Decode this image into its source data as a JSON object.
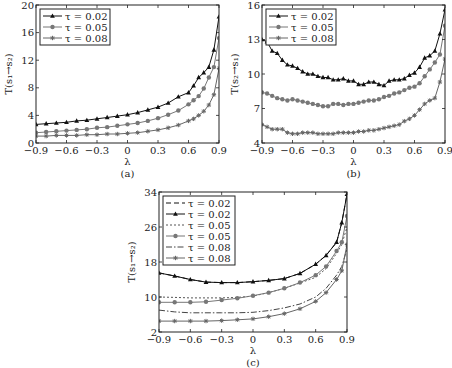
{
  "chart_data": [
    {
      "type": "line",
      "panel": "a",
      "caption": "(a)",
      "xlabel": "λ",
      "ylabel": "T(s₁→s₂)",
      "xlim": [
        -0.9,
        0.9
      ],
      "ylim": [
        0,
        20
      ],
      "xticks": [
        "-0.9",
        "-0.6",
        "-0.3",
        "0",
        "0.3",
        "0.6",
        "0.9"
      ],
      "yticks": [
        "0",
        "4",
        "8",
        "12",
        "16",
        "20"
      ],
      "grid": false,
      "legend_position": "upper left",
      "series": [
        {
          "name": "τ=0.02",
          "marker": "triangle",
          "line": "solid",
          "color": "#111111",
          "x": [
            -0.9,
            -0.8,
            -0.7,
            -0.6,
            -0.5,
            -0.4,
            -0.3,
            -0.2,
            -0.1,
            0,
            0.1,
            0.2,
            0.3,
            0.4,
            0.5,
            0.6,
            0.65,
            0.7,
            0.75,
            0.8,
            0.85,
            0.9
          ],
          "y": [
            2.7,
            2.8,
            2.9,
            3.0,
            3.2,
            3.3,
            3.5,
            3.7,
            3.9,
            4.1,
            4.4,
            4.8,
            5.2,
            5.8,
            6.7,
            7.3,
            8.3,
            9.5,
            10.2,
            11.0,
            13.5,
            18.3
          ]
        },
        {
          "name": "τ=0.05",
          "marker": "circle",
          "line": "solid",
          "color": "#777777",
          "x": [
            -0.9,
            -0.8,
            -0.7,
            -0.6,
            -0.5,
            -0.4,
            -0.3,
            -0.2,
            -0.1,
            0,
            0.1,
            0.2,
            0.3,
            0.4,
            0.5,
            0.6,
            0.65,
            0.7,
            0.75,
            0.8,
            0.85,
            0.9
          ],
          "y": [
            1.5,
            1.6,
            1.7,
            1.8,
            1.9,
            2.0,
            2.2,
            2.3,
            2.5,
            2.7,
            2.9,
            3.2,
            3.6,
            4.1,
            4.7,
            5.6,
            6.2,
            6.8,
            7.9,
            9.5,
            11.0,
            15.2
          ]
        },
        {
          "name": "τ=0.08",
          "marker": "star",
          "line": "solid",
          "color": "#666666",
          "x": [
            -0.9,
            -0.8,
            -0.7,
            -0.6,
            -0.5,
            -0.4,
            -0.3,
            -0.2,
            -0.1,
            0,
            0.1,
            0.2,
            0.3,
            0.4,
            0.5,
            0.6,
            0.65,
            0.7,
            0.75,
            0.8,
            0.85,
            0.9
          ],
          "y": [
            1.0,
            1.0,
            1.1,
            1.1,
            1.1,
            1.2,
            1.2,
            1.3,
            1.3,
            1.4,
            1.5,
            1.7,
            1.9,
            2.2,
            2.6,
            3.2,
            3.5,
            4.0,
            4.6,
            5.5,
            7.0,
            10.8
          ]
        }
      ]
    },
    {
      "type": "line",
      "panel": "b",
      "caption": "(b)",
      "xlabel": "λ",
      "ylabel": "T(s₂→s₁)",
      "xlim": [
        -0.9,
        0.9
      ],
      "ylim": [
        4,
        16
      ],
      "xticks": [
        "-0.9",
        "-0.6",
        "-0.3",
        "0",
        "0.3",
        "0.6",
        "0.9"
      ],
      "yticks": [
        "4",
        "7",
        "10",
        "13",
        "16"
      ],
      "grid": false,
      "legend_position": "upper left",
      "series": [
        {
          "name": "τ=0.02",
          "marker": "triangle",
          "line": "solid",
          "color": "#111111",
          "x": [
            -0.9,
            -0.85,
            -0.8,
            -0.75,
            -0.7,
            -0.65,
            -0.6,
            -0.55,
            -0.5,
            -0.45,
            -0.4,
            -0.35,
            -0.3,
            -0.25,
            -0.2,
            -0.15,
            -0.1,
            -0.05,
            0,
            0.05,
            0.1,
            0.15,
            0.2,
            0.25,
            0.3,
            0.35,
            0.4,
            0.45,
            0.5,
            0.55,
            0.6,
            0.65,
            0.7,
            0.75,
            0.8,
            0.85,
            0.9
          ],
          "y": [
            13.0,
            12.8,
            12.0,
            11.8,
            11.2,
            10.8,
            10.7,
            10.5,
            10.2,
            10.0,
            10.0,
            9.8,
            9.7,
            9.7,
            9.5,
            9.5,
            9.6,
            9.4,
            9.4,
            9.1,
            9.1,
            9.3,
            9.3,
            9.1,
            9.0,
            9.4,
            9.5,
            9.5,
            9.6,
            9.9,
            10.1,
            10.6,
            11.4,
            11.6,
            12.0,
            13.5,
            15.6
          ]
        },
        {
          "name": "τ=0.05",
          "marker": "circle",
          "line": "solid",
          "color": "#777777",
          "x": [
            -0.9,
            -0.85,
            -0.8,
            -0.75,
            -0.7,
            -0.65,
            -0.6,
            -0.55,
            -0.5,
            -0.45,
            -0.4,
            -0.35,
            -0.3,
            -0.25,
            -0.2,
            -0.15,
            -0.1,
            -0.05,
            0,
            0.05,
            0.1,
            0.15,
            0.2,
            0.25,
            0.3,
            0.35,
            0.4,
            0.45,
            0.5,
            0.55,
            0.6,
            0.65,
            0.7,
            0.75,
            0.8,
            0.85,
            0.9
          ],
          "y": [
            8.4,
            8.3,
            8.1,
            7.9,
            7.8,
            7.7,
            7.8,
            7.7,
            7.6,
            7.5,
            7.4,
            7.3,
            7.2,
            7.2,
            7.4,
            7.4,
            7.3,
            7.4,
            7.4,
            7.5,
            7.6,
            7.7,
            7.7,
            7.8,
            8.0,
            8.1,
            8.3,
            8.4,
            8.6,
            8.8,
            8.9,
            9.2,
            9.8,
            10.4,
            11.0,
            11.7,
            14.2
          ]
        },
        {
          "name": "τ=0.08",
          "marker": "star",
          "line": "solid",
          "color": "#666666",
          "x": [
            -0.9,
            -0.85,
            -0.8,
            -0.75,
            -0.7,
            -0.65,
            -0.6,
            -0.55,
            -0.5,
            -0.45,
            -0.4,
            -0.35,
            -0.3,
            -0.25,
            -0.2,
            -0.15,
            -0.1,
            -0.05,
            0,
            0.05,
            0.1,
            0.15,
            0.2,
            0.25,
            0.3,
            0.35,
            0.4,
            0.45,
            0.5,
            0.55,
            0.6,
            0.65,
            0.7,
            0.75,
            0.8,
            0.85,
            0.9
          ],
          "y": [
            5.6,
            5.4,
            5.2,
            5.2,
            5.2,
            4.9,
            4.8,
            4.8,
            4.9,
            4.9,
            4.9,
            4.8,
            4.8,
            4.8,
            4.8,
            4.9,
            4.9,
            4.9,
            4.9,
            5.0,
            5.0,
            5.1,
            5.1,
            5.2,
            5.3,
            5.4,
            5.5,
            5.6,
            5.9,
            6.1,
            6.4,
            6.9,
            7.4,
            7.7,
            7.9,
            9.3,
            11.3
          ]
        }
      ]
    },
    {
      "type": "line",
      "panel": "c",
      "caption": "(c)",
      "xlabel": "λ",
      "ylabel": "T(s₁→s₂)",
      "xlim": [
        -0.9,
        0.9
      ],
      "ylim": [
        2,
        34
      ],
      "xticks": [
        "-0.9",
        "-0.6",
        "-0.3",
        "0",
        "0.3",
        "0.6",
        "0.9"
      ],
      "yticks": [
        "2",
        "10",
        "18",
        "26",
        "34"
      ],
      "grid": false,
      "legend_position": "upper left",
      "series": [
        {
          "name": "τ=0.02",
          "marker": "none",
          "line": "dashed",
          "color": "#111111",
          "x": [
            -0.9,
            -0.75,
            -0.6,
            -0.45,
            -0.3,
            -0.15,
            0,
            0.15,
            0.3,
            0.45,
            0.6,
            0.7,
            0.8,
            0.85,
            0.9
          ],
          "y": [
            15.5,
            14.8,
            14.0,
            13.4,
            13.3,
            13.3,
            13.5,
            13.8,
            14.2,
            15.4,
            17.5,
            19.5,
            22.5,
            27.0,
            33.5
          ]
        },
        {
          "name": "τ=0.02",
          "marker": "triangle",
          "line": "solid",
          "color": "#111111",
          "x": [
            -0.9,
            -0.75,
            -0.6,
            -0.45,
            -0.3,
            -0.15,
            0,
            0.15,
            0.3,
            0.45,
            0.6,
            0.7,
            0.8,
            0.85,
            0.9
          ],
          "y": [
            15.5,
            14.8,
            14.0,
            13.4,
            13.3,
            13.3,
            13.5,
            13.8,
            14.2,
            15.4,
            17.5,
            19.5,
            22.5,
            27.0,
            33.5
          ]
        },
        {
          "name": "τ=0.05",
          "marker": "none",
          "line": "dotted",
          "color": "#555555",
          "x": [
            -0.9,
            -0.75,
            -0.6,
            -0.45,
            -0.3,
            -0.15,
            0,
            0.15,
            0.3,
            0.45,
            0.6,
            0.7,
            0.8,
            0.85,
            0.9
          ],
          "y": [
            10.0,
            9.9,
            9.8,
            9.8,
            9.8,
            9.9,
            10.2,
            11.0,
            12.0,
            13.2,
            14.5,
            16.5,
            20.0,
            22.0,
            26.0
          ]
        },
        {
          "name": "τ=0.05",
          "marker": "circle",
          "line": "solid",
          "color": "#777777",
          "x": [
            -0.9,
            -0.75,
            -0.6,
            -0.45,
            -0.3,
            -0.15,
            0,
            0.15,
            0.3,
            0.45,
            0.6,
            0.7,
            0.8,
            0.85,
            0.9
          ],
          "y": [
            8.8,
            8.8,
            8.8,
            8.9,
            9.3,
            9.7,
            10.3,
            11.0,
            12.0,
            13.3,
            15.0,
            17.0,
            20.5,
            22.5,
            28.5
          ]
        },
        {
          "name": "τ=0.08",
          "marker": "none",
          "line": "dashdot",
          "color": "#444444",
          "x": [
            -0.9,
            -0.75,
            -0.6,
            -0.45,
            -0.3,
            -0.15,
            0,
            0.15,
            0.3,
            0.45,
            0.6,
            0.7,
            0.8,
            0.85,
            0.9
          ],
          "y": [
            7.0,
            6.6,
            6.4,
            6.4,
            6.4,
            6.4,
            6.5,
            6.9,
            7.5,
            8.4,
            10.0,
            12.0,
            15.0,
            17.0,
            21.0
          ]
        },
        {
          "name": "τ=0.08",
          "marker": "star",
          "line": "solid",
          "color": "#666666",
          "x": [
            -0.9,
            -0.75,
            -0.6,
            -0.45,
            -0.3,
            -0.15,
            0,
            0.15,
            0.3,
            0.45,
            0.6,
            0.7,
            0.8,
            0.85,
            0.9
          ],
          "y": [
            4.5,
            4.5,
            4.5,
            4.5,
            4.6,
            4.8,
            5.0,
            5.5,
            6.2,
            7.3,
            9.0,
            11.0,
            14.0,
            16.0,
            22.0
          ]
        }
      ]
    }
  ]
}
